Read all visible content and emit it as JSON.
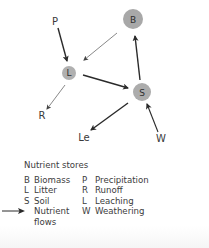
{
  "diagram": {
    "nodes": [
      {
        "id": "B",
        "label": "B",
        "x": 133,
        "y": 19,
        "r": 10,
        "fill": "#a8a8a8"
      },
      {
        "id": "L",
        "label": "L",
        "x": 69,
        "y": 73,
        "r": 7,
        "fill": "#b0b0b0"
      },
      {
        "id": "S",
        "label": "S",
        "x": 142,
        "y": 92,
        "r": 9,
        "fill": "#acacac"
      }
    ],
    "external_labels": [
      {
        "id": "P",
        "label": "P",
        "x": 55,
        "y": 25
      },
      {
        "id": "R",
        "label": "R",
        "x": 42,
        "y": 119
      },
      {
        "id": "Le",
        "label": "Le",
        "x": 84,
        "y": 141
      },
      {
        "id": "W",
        "label": "W",
        "x": 161,
        "y": 142
      }
    ],
    "flows": [
      {
        "from": "P",
        "to": "L",
        "weight": "thick"
      },
      {
        "from": "B",
        "to": "L",
        "weight": "thin"
      },
      {
        "from": "L",
        "to": "S",
        "weight": "thick"
      },
      {
        "from": "S",
        "to": "B",
        "weight": "thick"
      },
      {
        "from": "L",
        "to": "R",
        "weight": "thin"
      },
      {
        "from": "S",
        "to": "Le",
        "weight": "thick"
      },
      {
        "from": "W",
        "to": "S",
        "weight": "medium"
      }
    ],
    "arrow_color": "#2a2a2a"
  },
  "legend": {
    "title": "Nutrient stores",
    "stores": [
      {
        "abbr": "B",
        "name": "Biomass"
      },
      {
        "abbr": "L",
        "name": "Litter"
      },
      {
        "abbr": "S",
        "name": "Soil"
      }
    ],
    "flow_symbol": {
      "name_line1": "Nutrient",
      "name_line2": "flows"
    },
    "flows": [
      {
        "abbr": "P",
        "name": "Precipitation"
      },
      {
        "abbr": "R",
        "name": "Runoff"
      },
      {
        "abbr": "L",
        "name": "Leaching"
      },
      {
        "abbr": "W",
        "name": "Weathering"
      }
    ]
  }
}
